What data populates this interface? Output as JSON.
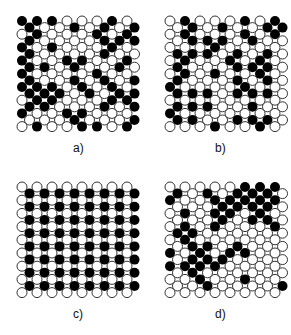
{
  "panels": [
    {
      "id": "a",
      "label": "a)",
      "x": 15,
      "y": 15,
      "labelX": 73,
      "labelY": 141,
      "rows": [
        [
          1,
          1,
          1,
          0,
          0,
          0,
          1,
          0
        ],
        [
          1,
          0,
          0,
          1,
          0,
          1,
          0,
          1
        ],
        [
          0,
          1,
          0,
          0,
          0,
          1,
          0,
          1
        ],
        [
          1,
          0,
          0,
          0,
          0,
          1,
          1,
          1
        ],
        [
          1,
          0,
          1,
          0,
          0,
          0,
          1,
          0
        ],
        [
          1,
          0,
          0,
          0,
          0,
          1,
          0,
          0
        ],
        [
          1,
          0,
          0,
          1,
          1,
          0,
          0,
          1
        ],
        [
          1,
          1,
          0,
          1,
          0,
          0,
          1,
          0
        ],
        [
          1,
          0,
          0,
          0,
          0,
          1,
          0,
          0
        ],
        [
          1,
          0,
          0,
          1,
          0,
          1,
          0,
          1
        ],
        [
          1,
          1,
          1,
          0,
          1,
          0,
          1,
          0
        ],
        [
          1,
          1,
          1,
          0,
          1,
          0,
          1,
          1
        ],
        [
          0,
          1,
          1,
          0,
          0,
          0,
          1,
          1
        ],
        [
          1,
          1,
          0,
          0,
          0,
          1,
          0,
          1
        ],
        [
          1,
          0,
          0,
          1,
          1,
          0,
          0,
          0
        ],
        [
          0,
          0,
          0,
          1,
          0,
          0,
          0,
          1
        ],
        [
          0,
          1,
          0,
          0,
          1,
          1,
          0,
          1
        ]
      ]
    },
    {
      "id": "b",
      "label": "b)",
      "x": 163,
      "y": 15,
      "labelX": 215,
      "labelY": 141,
      "rows": [
        [
          0,
          1,
          0,
          0,
          0,
          1,
          0,
          1
        ],
        [
          0,
          1,
          0,
          1,
          0,
          0,
          1,
          1
        ],
        [
          0,
          1,
          0,
          0,
          0,
          1,
          0,
          1
        ],
        [
          0,
          1,
          1,
          1,
          0,
          1,
          0,
          0
        ],
        [
          0,
          0,
          0,
          1,
          0,
          0,
          0,
          0
        ],
        [
          1,
          1,
          1,
          0,
          1,
          0,
          1,
          0
        ],
        [
          0,
          1,
          0,
          0,
          1,
          0,
          1,
          0
        ],
        [
          1,
          0,
          0,
          0,
          1,
          1,
          1,
          0
        ],
        [
          0,
          1,
          0,
          1,
          0,
          0,
          1,
          0
        ],
        [
          1,
          0,
          0,
          0,
          1,
          0,
          1,
          0
        ],
        [
          1,
          0,
          0,
          0,
          0,
          1,
          0,
          0
        ],
        [
          1,
          1,
          1,
          0,
          1,
          1,
          1,
          0
        ],
        [
          0,
          0,
          0,
          0,
          0,
          0,
          0,
          0
        ],
        [
          1,
          1,
          1,
          0,
          0,
          1,
          0,
          0
        ],
        [
          1,
          0,
          0,
          0,
          0,
          0,
          0,
          0
        ],
        [
          1,
          1,
          0,
          0,
          1,
          1,
          1,
          0
        ],
        [
          0,
          0,
          0,
          1,
          0,
          0,
          1,
          0
        ]
      ]
    },
    {
      "id": "c",
      "label": "c)",
      "x": 15,
      "y": 181,
      "labelX": 73,
      "labelY": 307,
      "rows": [
        [
          0,
          0,
          0,
          0,
          0,
          0,
          0,
          0
        ],
        [
          1,
          1,
          1,
          1,
          1,
          1,
          1,
          1
        ],
        [
          0,
          0,
          0,
          0,
          0,
          0,
          0,
          0
        ],
        [
          1,
          1,
          1,
          1,
          1,
          1,
          1,
          1
        ],
        [
          0,
          0,
          0,
          0,
          0,
          0,
          0,
          0
        ],
        [
          1,
          1,
          1,
          1,
          1,
          1,
          1,
          1
        ],
        [
          0,
          0,
          0,
          0,
          0,
          0,
          0,
          0
        ],
        [
          1,
          1,
          1,
          1,
          1,
          1,
          1,
          1
        ],
        [
          0,
          0,
          0,
          0,
          0,
          0,
          0,
          0
        ],
        [
          1,
          1,
          1,
          1,
          1,
          1,
          1,
          1
        ],
        [
          0,
          0,
          0,
          0,
          0,
          0,
          0,
          0
        ],
        [
          1,
          1,
          1,
          1,
          1,
          1,
          1,
          1
        ],
        [
          0,
          0,
          0,
          0,
          0,
          0,
          0,
          0
        ],
        [
          1,
          1,
          1,
          1,
          1,
          1,
          1,
          1
        ],
        [
          0,
          0,
          0,
          0,
          0,
          0,
          0,
          0
        ],
        [
          1,
          1,
          1,
          1,
          1,
          1,
          1,
          1
        ],
        [
          0,
          0,
          0,
          0,
          0,
          0,
          0,
          0
        ]
      ]
    },
    {
      "id": "d",
      "label": "d)",
      "x": 163,
      "y": 181,
      "labelX": 215,
      "labelY": 307,
      "rows": [
        [
          0,
          0,
          0,
          0,
          0,
          1,
          1,
          1
        ],
        [
          1,
          0,
          1,
          0,
          1,
          1,
          1,
          0
        ],
        [
          1,
          0,
          0,
          1,
          1,
          1,
          1,
          1
        ],
        [
          0,
          0,
          0,
          1,
          1,
          1,
          1,
          0
        ],
        [
          0,
          1,
          0,
          1,
          1,
          0,
          1,
          0
        ],
        [
          0,
          0,
          0,
          1,
          0,
          1,
          1,
          0
        ],
        [
          0,
          1,
          0,
          1,
          0,
          0,
          0,
          1
        ],
        [
          1,
          1,
          0,
          0,
          0,
          0,
          0,
          0
        ],
        [
          0,
          1,
          0,
          0,
          0,
          0,
          0,
          0
        ],
        [
          0,
          1,
          1,
          0,
          1,
          0,
          0,
          0
        ],
        [
          1,
          0,
          1,
          0,
          1,
          1,
          0,
          0
        ],
        [
          0,
          1,
          1,
          1,
          0,
          0,
          0,
          0
        ],
        [
          1,
          1,
          1,
          1,
          0,
          0,
          0,
          0
        ],
        [
          0,
          1,
          0,
          0,
          0,
          0,
          0,
          0
        ],
        [
          0,
          0,
          1,
          0,
          0,
          1,
          0,
          0
        ],
        [
          0,
          0,
          1,
          0,
          0,
          0,
          0,
          1
        ],
        [
          0,
          0,
          0,
          0,
          0,
          0,
          0,
          0
        ]
      ]
    }
  ],
  "style": {
    "filled": "#000000",
    "empty_fill": "#ffffff",
    "empty_stroke": "#333333"
  }
}
